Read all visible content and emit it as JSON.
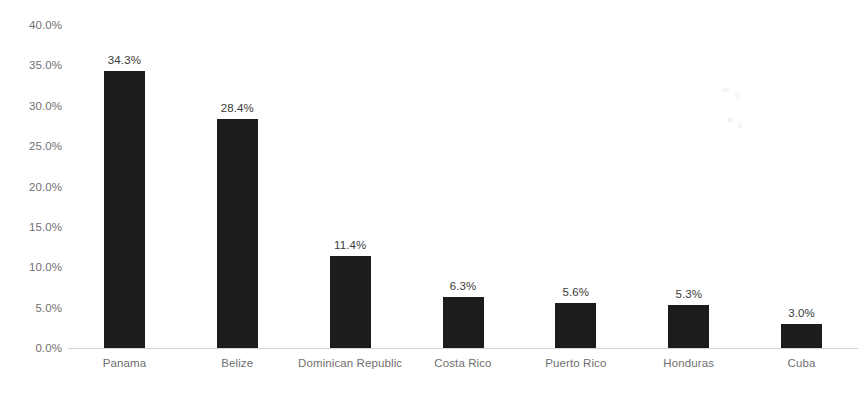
{
  "chart_data": {
    "type": "bar",
    "title": "",
    "subtitle": "",
    "xlabel": "",
    "ylabel": "",
    "categories": [
      "Panama",
      "Belize",
      "Dominican Republic",
      "Costa Rico",
      "Puerto Rico",
      "Honduras",
      "Cuba"
    ],
    "values": [
      34.3,
      28.4,
      11.4,
      6.3,
      5.6,
      5.3,
      3.0
    ],
    "data_labels": [
      "34.3%",
      "28.4%",
      "11.4%",
      "6.3%",
      "5.6%",
      "5.3%",
      "3.0%"
    ],
    "ylim": [
      0,
      40
    ],
    "ytick_values": [
      0,
      5,
      10,
      15,
      20,
      25,
      30,
      35,
      40
    ],
    "ytick_labels": [
      "0.0%",
      "5.0%",
      "10.0%",
      "15.0%",
      "20.0%",
      "25.0%",
      "30.0%",
      "35.0%",
      "40.0%"
    ],
    "grid": false,
    "legend": false,
    "legend_position": "none",
    "bar_color": "#1c1c1c",
    "axis_color": "#d2d2d2",
    "tick_label_color": "#6f6f6f",
    "data_label_color": "#3a3a3a",
    "background_color": "#ffffff"
  }
}
